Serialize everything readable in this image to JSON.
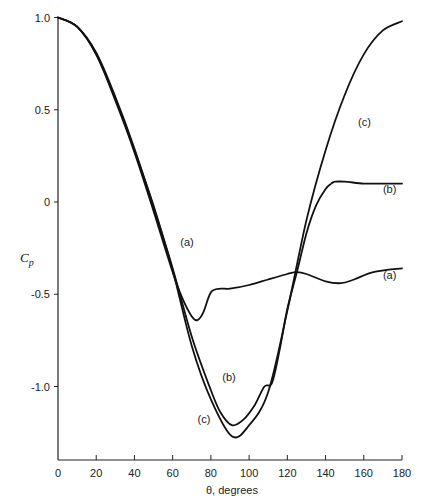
{
  "chart_data": {
    "type": "line",
    "title": "",
    "xlabel": "θ, degrees",
    "ylabel": "Cp",
    "xlim": [
      0,
      180
    ],
    "ylim": [
      -1.4,
      1.0
    ],
    "grid": false,
    "legend": "none (curves labeled inline)",
    "x_ticks": [
      0,
      20,
      40,
      60,
      80,
      100,
      120,
      140,
      160,
      180
    ],
    "x_tick_labels": [
      "0",
      "20",
      "40",
      "60",
      "80",
      "100",
      "120",
      "140",
      "160",
      "180"
    ],
    "y_ticks": [
      1.0,
      0.5,
      0,
      -0.5,
      -1.0
    ],
    "y_tick_labels": [
      "1.0",
      "0.5",
      "0",
      "-0.5",
      "-1.0"
    ],
    "series": [
      {
        "name": "(a)",
        "x": [
          0,
          10,
          20,
          30,
          40,
          50,
          60,
          65,
          70,
          73,
          76,
          80,
          85,
          90,
          100,
          110,
          120,
          125,
          130,
          140,
          148,
          155,
          165,
          180
        ],
        "values": [
          1.0,
          0.95,
          0.8,
          0.55,
          0.27,
          -0.05,
          -0.38,
          -0.52,
          -0.62,
          -0.64,
          -0.6,
          -0.49,
          -0.47,
          -0.47,
          -0.45,
          -0.42,
          -0.39,
          -0.38,
          -0.39,
          -0.43,
          -0.44,
          -0.42,
          -0.38,
          -0.36
        ],
        "label_pos": {
          "x": 64,
          "y": -0.24
        }
      },
      {
        "name": "(b)",
        "x": [
          0,
          10,
          20,
          30,
          40,
          50,
          60,
          70,
          80,
          85,
          91,
          97,
          103,
          108,
          112,
          116,
          120,
          125,
          130,
          135,
          140,
          143,
          145,
          150,
          160,
          170,
          180
        ],
        "values": [
          1.0,
          0.95,
          0.81,
          0.57,
          0.29,
          -0.03,
          -0.36,
          -0.73,
          -1.02,
          -1.14,
          -1.21,
          -1.18,
          -1.1,
          -1.0,
          -0.98,
          -0.8,
          -0.58,
          -0.38,
          -0.17,
          -0.02,
          0.07,
          0.1,
          0.11,
          0.11,
          0.1,
          0.1,
          0.1
        ],
        "label_pos": {
          "x": 86,
          "y": -0.97
        },
        "label_pos_2": {
          "x": 170,
          "y": 0.05
        }
      },
      {
        "name": "(c)",
        "x": [
          0,
          10,
          20,
          30,
          40,
          50,
          60,
          70,
          80,
          91,
          100,
          110,
          120,
          130,
          140,
          150,
          160,
          170,
          180
        ],
        "values": [
          1.0,
          0.95,
          0.8,
          0.56,
          0.28,
          -0.02,
          -0.37,
          -0.78,
          -1.07,
          -1.27,
          -1.21,
          -1.03,
          -0.59,
          -0.1,
          0.28,
          0.58,
          0.8,
          0.93,
          0.98
        ],
        "label_pos": {
          "x": 73,
          "y": -1.2
        },
        "label_pos_2": {
          "x": 157,
          "y": 0.41
        }
      }
    ]
  }
}
